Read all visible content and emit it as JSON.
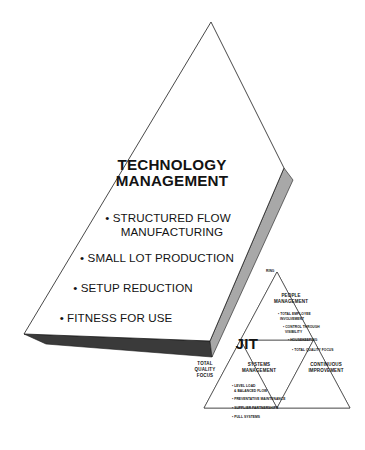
{
  "figure": {
    "type": "pyramid-framework-diagram",
    "background_color": "#ffffff",
    "outline_color": "#1a1a1a",
    "face_light_gray": "#a8a8a8",
    "face_dark_gray": "#3a3a3a",
    "text_color": "#131313"
  },
  "main_pyramid": {
    "title_line_1": "TECHNOLOGY",
    "title_line_2": "MANAGEMENT",
    "bullets": [
      {
        "text_line_1": "• STRUCTURED FLOW",
        "text_line_2": "MANUFACTURING"
      },
      {
        "text_line_1": "• SMALL LOT PRODUCTION",
        "text_line_2": ""
      },
      {
        "text_line_1": "• SETUP REDUCTION",
        "text_line_2": ""
      },
      {
        "text_line_1": "• FITNESS FOR USE",
        "text_line_2": ""
      }
    ]
  },
  "jit_pyramid": {
    "label": "JIT",
    "occluded_label": "RING",
    "corner_left": {
      "line_1": "TOTAL",
      "line_2": "QUALITY",
      "line_3": "FOCUS"
    },
    "corner_right": {
      "line_1": "CONTINUOUS",
      "line_2": "IMPROVEMENT"
    },
    "top_section": {
      "heading_line_1": "PEOPLE",
      "heading_line_2": "MANAGEMENT",
      "bullets": [
        {
          "line_1": "• TOTAL EMPLOYEE",
          "line_2": "INVOLVEMENT"
        },
        {
          "line_1": "• CONTROL THROUGH",
          "line_2": "VISIBILITY"
        },
        {
          "line_1": "• HOUSEKEEPING",
          "line_2": ""
        },
        {
          "line_1": "• TOTAL QUALITY FOCUS",
          "line_2": ""
        }
      ]
    },
    "center_section": {
      "heading_line_1": "SYSTEMS",
      "heading_line_2": "MANAGEMENT",
      "bullets": [
        {
          "line_1": "• LEVEL LOAD",
          "line_2": "& BALANCED FLOW"
        },
        {
          "line_1": "• PREVENTATIVE MAINTENANCE",
          "line_2": ""
        },
        {
          "line_1": "• SUPPLIER PARTNERSHIPS",
          "line_2": ""
        },
        {
          "line_1": "• PULL SYSTEMS",
          "line_2": ""
        }
      ]
    }
  }
}
